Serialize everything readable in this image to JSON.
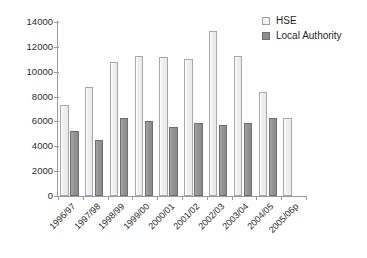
{
  "chart_data": {
    "type": "bar",
    "title": "",
    "xlabel": "",
    "ylabel": "",
    "ylim": [
      0,
      14000
    ],
    "ytick_step": 2000,
    "ytick_labels": [
      "0",
      "2000",
      "4000",
      "6000",
      "8000",
      "10000",
      "12000",
      "14000"
    ],
    "grid": false,
    "legend_position": "top-right",
    "categories": [
      "1996/97",
      "1997/98",
      "1998/99",
      "1999/00",
      "2000/01",
      "2001/02",
      "2002/03",
      "2003/04",
      "2004/05",
      "2005/06p"
    ],
    "series": [
      {
        "name": "HSE",
        "color": "#efefef",
        "values": [
          7350,
          8750,
          10750,
          11250,
          11200,
          11050,
          13300,
          11250,
          8350,
          6300
        ]
      },
      {
        "name": "Local Authority",
        "color": "#8f8f8f",
        "values": [
          5200,
          4500,
          6300,
          6050,
          5550,
          5900,
          5750,
          5900,
          6300,
          null
        ]
      }
    ]
  },
  "legend": {
    "items": [
      {
        "label": "HSE",
        "swatch": "hse"
      },
      {
        "label": "Local Authority",
        "swatch": "la"
      }
    ]
  }
}
